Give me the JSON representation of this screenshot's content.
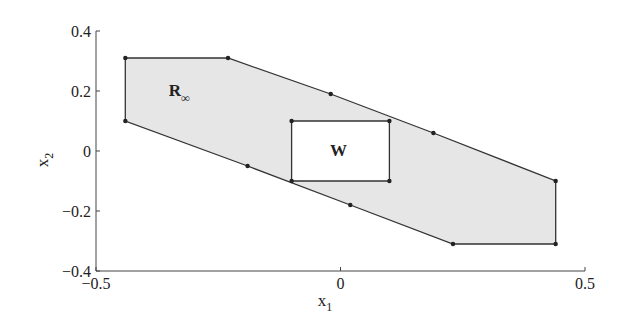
{
  "chart_data": {
    "type": "area",
    "title": "",
    "xlabel": "x1",
    "ylabel": "x2",
    "xlim": [
      -0.5,
      0.5
    ],
    "ylim": [
      -0.4,
      0.4
    ],
    "x_ticks": [
      "-0.5",
      "0",
      "0.5"
    ],
    "y_ticks": [
      "0.4",
      "0.2",
      "0",
      "-0.2",
      "-0.4"
    ],
    "grid": false,
    "series": [
      {
        "name": "R∞",
        "label": "R",
        "label_sub": "∞",
        "fill": "#e6e6e6",
        "stroke": "#333333",
        "vertices": [
          [
            -0.44,
            0.31
          ],
          [
            -0.23,
            0.31
          ],
          [
            -0.02,
            0.19
          ],
          [
            0.19,
            0.06
          ],
          [
            0.44,
            -0.1
          ],
          [
            0.44,
            -0.31
          ],
          [
            0.23,
            -0.31
          ],
          [
            0.02,
            -0.18
          ],
          [
            -0.19,
            -0.05
          ],
          [
            -0.44,
            0.1
          ]
        ]
      },
      {
        "name": "W",
        "label": "W",
        "fill": "#ffffff",
        "stroke": "#333333",
        "vertices": [
          [
            -0.1,
            0.1
          ],
          [
            0.1,
            0.1
          ],
          [
            0.1,
            -0.1
          ],
          [
            -0.1,
            -0.1
          ]
        ]
      }
    ]
  },
  "axes": {
    "xlabel_main": "x",
    "xlabel_sub": "1",
    "ylabel_main": "x",
    "ylabel_sub": "2"
  }
}
